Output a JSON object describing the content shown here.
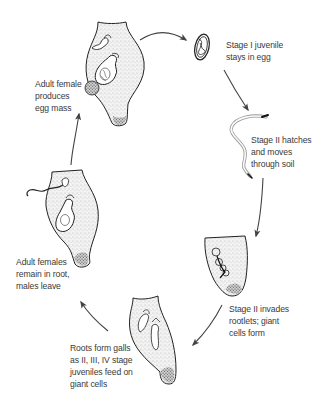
{
  "diagram": {
    "type": "life-cycle",
    "colors": {
      "ink": "#222222",
      "arrow": "#444444",
      "text": "#3a3a3a",
      "gall_fill": "#f0f0f0",
      "background": "#ffffff"
    },
    "stages": [
      {
        "id": "egg",
        "icon": "nematode-egg-icon",
        "label_lines": [
          "Stage I juvenile",
          "stays in egg"
        ]
      },
      {
        "id": "hatch",
        "icon": "juvenile-worm-icon",
        "label_lines": [
          "Stage II hatches",
          "and moves",
          "through soil"
        ]
      },
      {
        "id": "invade",
        "icon": "root-tip-icon",
        "label_lines": [
          "Stage II invades",
          "rootlets; giant",
          "cells form"
        ]
      },
      {
        "id": "galls",
        "icon": "root-gall-icon",
        "label_lines": [
          "Roots form galls",
          "as II, III, IV stage",
          "juveniles feed on",
          "giant cells"
        ]
      },
      {
        "id": "adults",
        "icon": "root-gall-adults-icon",
        "label_lines": [
          "Adult females",
          "remain in root,",
          "males leave"
        ]
      },
      {
        "id": "egg-mass",
        "icon": "root-gall-egg-mass-icon",
        "label_lines": [
          "Adult female",
          "produces",
          "egg mass"
        ]
      }
    ]
  }
}
